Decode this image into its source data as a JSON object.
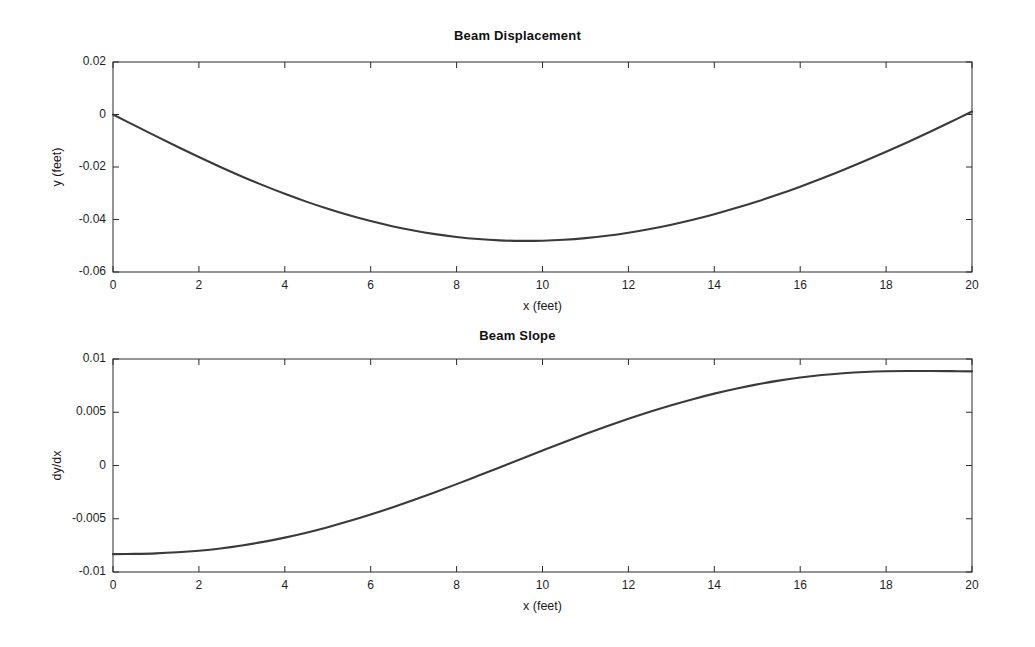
{
  "figure": {
    "background": "#ffffff",
    "curve_color": "#3a3a3a",
    "axis_color": "#2b2b2b"
  },
  "chart_data": [
    {
      "type": "line",
      "title": "Beam Displacement",
      "xlabel": "x (feet)",
      "ylabel": "y (feet)",
      "xlim": [
        0,
        20
      ],
      "ylim": [
        -0.06,
        0.02
      ],
      "xticks": [
        0,
        2,
        4,
        6,
        8,
        10,
        12,
        14,
        16,
        18,
        20
      ],
      "xticklabels": [
        "0",
        "2",
        "4",
        "6",
        "8",
        "10",
        "12",
        "14",
        "16",
        "18",
        "20"
      ],
      "yticks": [
        0.02,
        0,
        -0.02,
        -0.04,
        -0.06
      ],
      "yticklabels": [
        "0.02",
        "0",
        "-0.02",
        "-0.04",
        "-0.06"
      ],
      "grid": false,
      "legend": null,
      "series": [
        {
          "name": "y",
          "x": [
            0,
            0.5,
            1,
            1.5,
            2,
            2.5,
            3,
            3.5,
            4,
            4.5,
            5,
            5.5,
            6,
            6.5,
            7,
            7.5,
            8,
            8.5,
            9,
            9.5,
            10,
            10.5,
            11,
            11.5,
            12,
            12.5,
            13,
            13.5,
            14,
            14.5,
            15,
            15.5,
            16,
            16.5,
            17,
            17.5,
            18,
            18.5,
            19,
            19.5,
            20
          ],
          "values": [
            0.0,
            -0.00415,
            -0.00826,
            -0.01229,
            -0.01621,
            -0.01998,
            -0.02359,
            -0.02701,
            -0.03021,
            -0.03319,
            -0.03592,
            -0.0384,
            -0.04061,
            -0.04255,
            -0.0442,
            -0.04557,
            -0.04665,
            -0.04744,
            -0.04794,
            -0.04815,
            -0.04808,
            -0.04773,
            -0.0471,
            -0.04621,
            -0.04505,
            -0.04364,
            -0.04199,
            -0.0401,
            -0.03799,
            -0.03566,
            -0.03313,
            -0.0304,
            -0.02749,
            -0.0244,
            -0.02115,
            -0.01775,
            -0.01421,
            -0.01054,
            -0.00676,
            -0.00287,
            0.00112
          ]
        }
      ]
    },
    {
      "type": "line",
      "title": "Beam Slope",
      "xlabel": "x (feet)",
      "ylabel": "dy/dx",
      "xlim": [
        0,
        20
      ],
      "ylim": [
        -0.01,
        0.01
      ],
      "xticks": [
        0,
        2,
        4,
        6,
        8,
        10,
        12,
        14,
        16,
        18,
        20
      ],
      "xticklabels": [
        "0",
        "2",
        "4",
        "6",
        "8",
        "10",
        "12",
        "14",
        "16",
        "18",
        "20"
      ],
      "yticks": [
        0.01,
        0.005,
        0,
        -0.005,
        -0.01
      ],
      "yticklabels": [
        "0.01",
        "0.005",
        "0",
        "-0.005",
        "-0.01"
      ],
      "grid": false,
      "legend": null,
      "series": [
        {
          "name": "dy/dx",
          "x": [
            0,
            0.5,
            1,
            1.5,
            2,
            2.5,
            3,
            3.5,
            4,
            4.5,
            5,
            5.5,
            6,
            6.5,
            7,
            7.5,
            8,
            8.5,
            9,
            9.5,
            10,
            10.5,
            11,
            11.5,
            12,
            12.5,
            13,
            13.5,
            14,
            14.5,
            15,
            15.5,
            16,
            16.5,
            17,
            17.5,
            18,
            18.5,
            19,
            19.5,
            20
          ],
          "values": [
            -0.00832,
            -0.0083,
            -0.00825,
            -0.00815,
            -0.008,
            -0.00779,
            -0.00751,
            -0.00717,
            -0.00677,
            -0.00631,
            -0.00579,
            -0.00522,
            -0.0046,
            -0.00394,
            -0.00324,
            -0.00251,
            -0.00175,
            -0.00097,
            -0.00018,
            0.00062,
            0.00141,
            0.00219,
            0.00295,
            0.00368,
            0.00438,
            0.00504,
            0.00566,
            0.00623,
            0.00675,
            0.00721,
            0.00762,
            0.00797,
            0.00826,
            0.00849,
            0.00866,
            0.00878,
            0.00885,
            0.00888,
            0.00888,
            0.00886,
            0.00884
          ]
        }
      ]
    }
  ]
}
